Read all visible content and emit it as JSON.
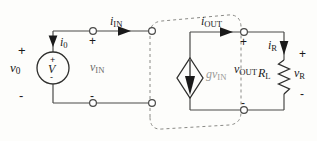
{
  "figure": {
    "type": "circuit-schematic",
    "background": "#fdfdfb",
    "wire_color": "#4a4a48",
    "dashed_box_color": "#8a8a86"
  },
  "labels": {
    "v0": "v",
    "v0_sub": "0",
    "i0": "i",
    "i0_sub": "0",
    "iIN": "i",
    "iIN_sub": "IN",
    "vIN": "v",
    "vIN_sub": "IN",
    "iOUT": "i",
    "iOUT_sub": "OUT",
    "gvIN_g": "g",
    "gvIN_v": "v",
    "gvIN_sub": "IN",
    "vOUT": "v",
    "vOUT_sub": "OUT",
    "iR": "i",
    "iR_sub": "R",
    "RL": "R",
    "RL_sub": "L",
    "vR": "v",
    "vR_sub": "R",
    "source_symbol": "V",
    "plus": "+",
    "minus": "-"
  },
  "components": [
    {
      "name": "independent-voltage-source",
      "symbol": "circle-with-V",
      "label": "v0",
      "polarity_top": "+",
      "polarity_bottom": "-"
    },
    {
      "name": "dependent-current-source",
      "symbol": "diamond-with-down-arrow",
      "label": "gvIN"
    },
    {
      "name": "load-resistor",
      "symbol": "zigzag",
      "label": "RL",
      "voltage_label": "vR"
    }
  ],
  "currents": [
    {
      "name": "i0",
      "direction": "down"
    },
    {
      "name": "iIN",
      "direction": "right"
    },
    {
      "name": "iOUT",
      "direction": "right"
    },
    {
      "name": "iR",
      "direction": "down"
    }
  ],
  "ports": [
    {
      "name": "input-port",
      "terminals": 4,
      "voltage": "vIN",
      "plus": "top",
      "minus": "bottom"
    },
    {
      "name": "output-port",
      "terminals": 4,
      "voltage": "vOUT",
      "plus": "top",
      "minus": "bottom"
    }
  ]
}
